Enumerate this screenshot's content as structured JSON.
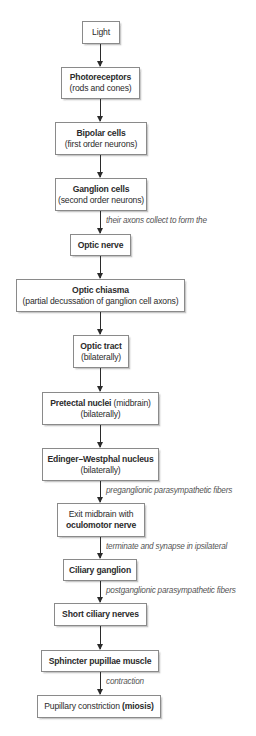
{
  "diagram": {
    "type": "vertical-flowchart",
    "colors": {
      "box_border": "#8a8a8a",
      "box_fill": "#ffffff",
      "text": "#2b2b2b",
      "annotation_text": "#555555",
      "arrow": "#2b2b2b"
    },
    "nodes": [
      {
        "id": "light",
        "title": "Light",
        "subtitle": ""
      },
      {
        "id": "photoreceptors",
        "title": "Photoreceptors",
        "subtitle": "(rods and cones)"
      },
      {
        "id": "bipolar",
        "title": "Bipolar cells",
        "subtitle": "(first order neurons)"
      },
      {
        "id": "ganglion",
        "title": "Ganglion cells",
        "subtitle": "(second order neurons)"
      },
      {
        "id": "optic_nerve",
        "title": "Optic nerve",
        "subtitle": ""
      },
      {
        "id": "optic_chiasma",
        "title": "Optic chiasma",
        "subtitle": "(partial decussation of ganglion cell axons)"
      },
      {
        "id": "optic_tract",
        "title": "Optic tract",
        "subtitle": "(bilaterally)"
      },
      {
        "id": "pretectal",
        "title": "Pretectal nuclei",
        "title_suffix": " (midbrain)",
        "subtitle": "(bilaterally)"
      },
      {
        "id": "edinger",
        "title": "Edinger–Westphal nucleus",
        "subtitle": "(bilaterally)"
      },
      {
        "id": "exit_midbrain",
        "prefix": "Exit midbrain with",
        "title": "oculomotor nerve"
      },
      {
        "id": "ciliary_ganglion",
        "title": "Ciliary ganglion",
        "subtitle": ""
      },
      {
        "id": "short_ciliary",
        "title": "Short ciliary nerves",
        "subtitle": ""
      },
      {
        "id": "sphincter",
        "title": "Sphincter pupillae muscle",
        "subtitle": ""
      },
      {
        "id": "constriction",
        "prefix": "Pupillary constriction ",
        "title": "(miosis)"
      }
    ],
    "edges": [
      {
        "from": "light",
        "to": "photoreceptors",
        "label": ""
      },
      {
        "from": "photoreceptors",
        "to": "bipolar",
        "label": ""
      },
      {
        "from": "bipolar",
        "to": "ganglion",
        "label": ""
      },
      {
        "from": "ganglion",
        "to": "optic_nerve",
        "label": "their axons collect to form the"
      },
      {
        "from": "optic_nerve",
        "to": "optic_chiasma",
        "label": ""
      },
      {
        "from": "optic_chiasma",
        "to": "optic_tract",
        "label": ""
      },
      {
        "from": "optic_tract",
        "to": "pretectal",
        "label": ""
      },
      {
        "from": "pretectal",
        "to": "edinger",
        "label": ""
      },
      {
        "from": "edinger",
        "to": "exit_midbrain",
        "label": "preganglionic parasympathetic fibers"
      },
      {
        "from": "exit_midbrain",
        "to": "ciliary_ganglion",
        "label": "terminate and synapse in ipsilateral"
      },
      {
        "from": "ciliary_ganglion",
        "to": "short_ciliary",
        "label": "postganglionic parasympathetic fibers"
      },
      {
        "from": "short_ciliary",
        "to": "sphincter",
        "label": ""
      },
      {
        "from": "sphincter",
        "to": "constriction",
        "label": "contraction"
      }
    ]
  }
}
